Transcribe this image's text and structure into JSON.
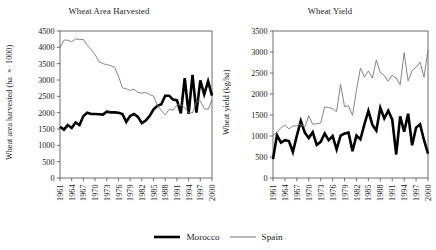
{
  "figure": {
    "width": 436,
    "height": 250,
    "background": "#ffffff"
  },
  "legend": {
    "position": "bottom-center",
    "entries": [
      {
        "label": "Morocco",
        "color": "#000000",
        "width": 2.6,
        "swatch_name": "legend-swatch-morocco"
      },
      {
        "label": "Spain",
        "color": "#777777",
        "width": 0.9,
        "swatch_name": "legend-swatch-spain"
      }
    ]
  },
  "chart_data": [
    {
      "type": "line",
      "id": "wheat-area-harvested",
      "title": "Wheat Area Harvested",
      "xlabel": "",
      "ylabel": "Wheat area harvested (ha × 1000)",
      "ylim": [
        0,
        4500
      ],
      "yticks": [
        0,
        500,
        1000,
        1500,
        2000,
        2500,
        3000,
        3500,
        4000,
        4500
      ],
      "xlim": [
        1961,
        2000
      ],
      "xticks": [
        1961,
        1964,
        1967,
        1970,
        1973,
        1976,
        1979,
        1982,
        1985,
        1988,
        1991,
        1994,
        1997,
        2000
      ],
      "xtick_rotation": 90,
      "grid": false,
      "x": [
        1961,
        1962,
        1963,
        1964,
        1965,
        1966,
        1967,
        1968,
        1969,
        1970,
        1971,
        1972,
        1973,
        1974,
        1975,
        1976,
        1977,
        1978,
        1979,
        1980,
        1981,
        1982,
        1983,
        1984,
        1985,
        1986,
        1987,
        1988,
        1989,
        1990,
        1991,
        1992,
        1993,
        1994,
        1995,
        1996,
        1997,
        1998,
        1999,
        2000
      ],
      "series": [
        {
          "name": "Morocco",
          "color": "#000000",
          "width": 2.6,
          "values": [
            1570,
            1480,
            1620,
            1530,
            1700,
            1620,
            1900,
            2000,
            1960,
            1960,
            1950,
            1940,
            2030,
            2010,
            2010,
            2000,
            1960,
            1720,
            1900,
            1960,
            1870,
            1680,
            1760,
            1900,
            2100,
            2210,
            2260,
            2520,
            2520,
            2400,
            2380,
            1980,
            3060,
            1960,
            3160,
            2000,
            2990,
            2560,
            2960,
            2520
          ]
        },
        {
          "name": "Spain",
          "color": "#777777",
          "width": 0.9,
          "values": [
            3980,
            4220,
            4220,
            4170,
            4260,
            4240,
            4240,
            4060,
            3930,
            3780,
            3560,
            3500,
            3470,
            3440,
            3390,
            3120,
            2760,
            2730,
            2680,
            2720,
            2620,
            2600,
            2620,
            2550,
            2510,
            2220,
            2060,
            1930,
            2100,
            2080,
            2230,
            2250,
            2150,
            2000,
            1990,
            2350,
            2360,
            2120,
            2100,
            2390
          ]
        }
      ]
    },
    {
      "type": "line",
      "id": "wheat-yield",
      "title": "Wheat Yield",
      "xlabel": "",
      "ylabel": "Wheat yield (kg/ha)",
      "ylim": [
        0,
        3500
      ],
      "yticks": [
        0,
        500,
        1000,
        1500,
        2000,
        2500,
        3000,
        3500
      ],
      "xlim": [
        1961,
        2000
      ],
      "xticks": [
        1961,
        1964,
        1967,
        1970,
        1973,
        1976,
        1979,
        1982,
        1985,
        1988,
        1991,
        1994,
        1997,
        2000
      ],
      "xtick_rotation": 90,
      "grid": false,
      "x": [
        1961,
        1962,
        1963,
        1964,
        1965,
        1966,
        1967,
        1968,
        1969,
        1970,
        1971,
        1972,
        1973,
        1974,
        1975,
        1976,
        1977,
        1978,
        1979,
        1980,
        1981,
        1982,
        1983,
        1984,
        1985,
        1986,
        1987,
        1988,
        1989,
        1990,
        1991,
        1992,
        1993,
        1994,
        1995,
        1996,
        1997,
        1998,
        1999,
        2000
      ],
      "series": [
        {
          "name": "Morocco",
          "color": "#000000",
          "width": 2.6,
          "values": [
            450,
            1020,
            840,
            900,
            880,
            620,
            1010,
            1360,
            1080,
            950,
            1090,
            790,
            860,
            1060,
            900,
            1000,
            680,
            1010,
            1060,
            1080,
            640,
            1010,
            920,
            1280,
            1600,
            1270,
            1130,
            1670,
            1420,
            1600,
            1390,
            560,
            1470,
            1100,
            1530,
            780,
            1200,
            1280,
            900,
            580
          ]
        },
        {
          "name": "Spain",
          "color": "#777777",
          "width": 0.9,
          "values": [
            1020,
            1080,
            1200,
            1260,
            1170,
            1240,
            1240,
            1280,
            1210,
            1480,
            1280,
            1290,
            1310,
            1690,
            1680,
            1650,
            1580,
            2230,
            1700,
            1720,
            1490,
            2090,
            2620,
            2400,
            2550,
            2380,
            2810,
            2510,
            2440,
            2300,
            2450,
            2380,
            2220,
            2980,
            2310,
            2560,
            2640,
            2760,
            2400,
            3050
          ]
        }
      ]
    }
  ]
}
